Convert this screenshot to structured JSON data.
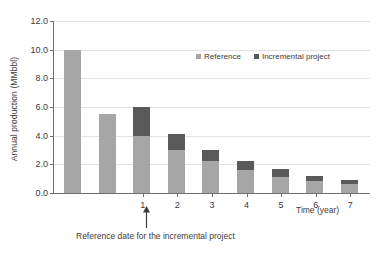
{
  "chart_data": {
    "type": "bar",
    "title": "",
    "subtitle": "",
    "xlabel": "Time (year)",
    "ylabel": "Annual production (MMbbl)",
    "ylim": [
      0,
      12
    ],
    "ytick_labels": [
      "0.0",
      "2.0",
      "4.0",
      "6.0",
      "8.0",
      "10.0",
      "12.0"
    ],
    "ytick_values": [
      0,
      2,
      4,
      6,
      8,
      10,
      12
    ],
    "xtick_labels": [
      "1",
      "2",
      "3",
      "4",
      "5",
      "6",
      "7"
    ],
    "xtick_bar_index": [
      2,
      3,
      4,
      5,
      6,
      7,
      8
    ],
    "categories": [
      "-2",
      "-1",
      "1",
      "2",
      "3",
      "4",
      "5",
      "6",
      "7"
    ],
    "stacked": true,
    "grid": "horizontal",
    "legend_position": "inside-top-right",
    "series": [
      {
        "name": "Reference",
        "color": "#a6a6a6",
        "values": [
          10.0,
          5.5,
          4.0,
          3.0,
          2.2,
          1.6,
          1.15,
          0.85,
          0.65
        ]
      },
      {
        "name": "Incremental project",
        "color": "#595959",
        "values": [
          0,
          0,
          2.0,
          1.1,
          0.8,
          0.65,
          0.5,
          0.35,
          0.25
        ]
      }
    ],
    "totals": [
      10.0,
      5.5,
      6.0,
      4.1,
      3.0,
      2.25,
      1.65,
      1.2,
      0.9
    ],
    "annotation": {
      "caption": "Reference date for the incremental project",
      "points_to_xtick": "1",
      "arrow": "up-arrow"
    }
  },
  "legend": {
    "items": [
      {
        "label": "Reference",
        "color": "#a6a6a6"
      },
      {
        "label": "Incremental project",
        "color": "#595959"
      }
    ]
  }
}
